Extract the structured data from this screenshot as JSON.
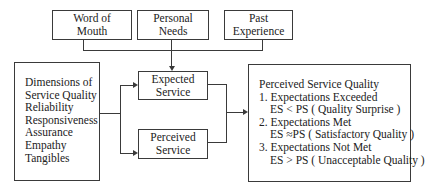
{
  "top_boxes": [
    {
      "lines": [
        "Word of",
        "Mouth"
      ]
    },
    {
      "lines": [
        "Personal",
        "Needs"
      ]
    },
    {
      "lines": [
        "Past",
        "Experience"
      ]
    }
  ],
  "dimensions": {
    "title_lines": [
      "Dimensions of",
      "Service Quality"
    ],
    "items": [
      "Reliability",
      "Responsiveness",
      "Assurance",
      "Empathy",
      "Tangibles"
    ]
  },
  "expected": {
    "lines": [
      "Expected",
      "Service"
    ]
  },
  "perceived": {
    "lines": [
      "Perceived",
      "Service"
    ]
  },
  "result": {
    "title": "Perceived Service Quality",
    "items": [
      {
        "heading": "1. Expectations Exceeded",
        "detail": "ES < PS ( Quality Surprise )"
      },
      {
        "heading": "2. Expectations Met",
        "detail": "ES ≈PS ( Satisfactory Quality )"
      },
      {
        "heading": "3. Expectations Not Met",
        "detail": "ES > PS ( Unacceptable Quality )"
      }
    ]
  }
}
